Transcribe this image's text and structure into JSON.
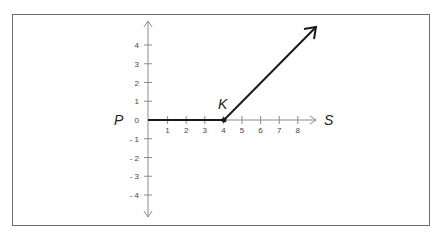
{
  "chart_data": {
    "type": "line",
    "title": "",
    "xlabel": "S",
    "ylabel": "P",
    "annotations": [
      {
        "text": "K",
        "x": 4,
        "y": 0
      }
    ],
    "x_ticks": [
      "1",
      "2",
      "3",
      "4",
      "5",
      "6",
      "7",
      "8"
    ],
    "y_ticks": [
      "4",
      "3",
      "2",
      "1",
      "0",
      "- 1",
      "- 2",
      "- 3",
      "- 4"
    ],
    "xlim": [
      0,
      9
    ],
    "ylim": [
      -5,
      5
    ],
    "grid": false,
    "legend": null,
    "series": [
      {
        "name": "payoff",
        "points": [
          [
            0,
            0
          ],
          [
            4,
            0
          ],
          [
            9,
            5
          ]
        ],
        "arrow_end": true,
        "color": "#1a1a1a"
      }
    ]
  },
  "labels": {
    "p": "P",
    "s": "S",
    "k": "K"
  },
  "colors": {
    "axis": "#8a8a8a",
    "payoff_line": "#1a1a1a",
    "frame": "#6e6e6e"
  }
}
